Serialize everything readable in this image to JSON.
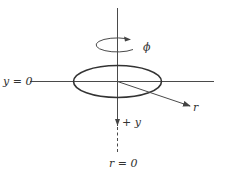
{
  "diagram": {
    "labels": {
      "phi": "ϕ",
      "y_zero": "y = 0",
      "r": "r",
      "plus_y": "+ y",
      "r_zero": "r = 0"
    },
    "colors": {
      "line": "#4a4a4a",
      "ring": "#333333",
      "background": "#ffffff"
    }
  }
}
